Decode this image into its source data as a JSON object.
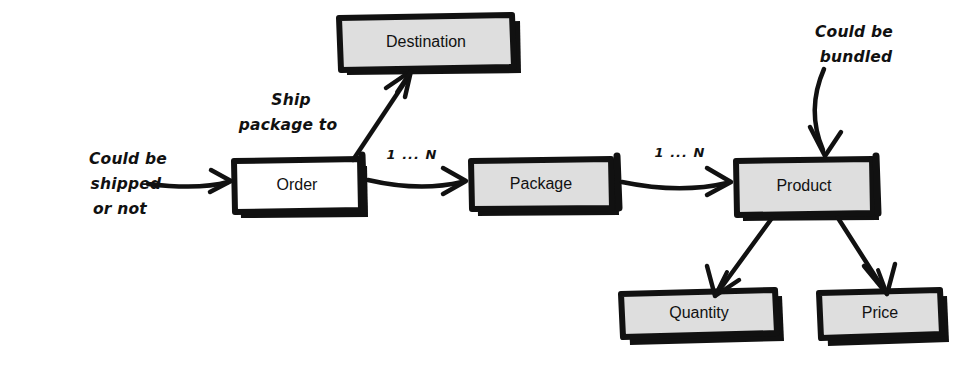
{
  "diagram": {
    "style": "hand-drawn sketch, black ink on white",
    "colors": {
      "ink": "#111111",
      "background": "#ffffff",
      "box_fill_gray": "#dedede",
      "box_fill_white": "#ffffff"
    },
    "nodes": [
      {
        "id": "destination",
        "label": "Destination",
        "fill": "#dedede",
        "x": 338,
        "y": 17,
        "width": 174,
        "height": 50
      },
      {
        "id": "order",
        "label": "Order",
        "fill": "#ffffff",
        "x": 233,
        "y": 160,
        "width": 127,
        "height": 50
      },
      {
        "id": "package",
        "label": "Package",
        "fill": "#dedede",
        "x": 470,
        "y": 160,
        "width": 142,
        "height": 48
      },
      {
        "id": "product",
        "label": "Product",
        "fill": "#dedede",
        "x": 735,
        "y": 160,
        "width": 137,
        "height": 53
      },
      {
        "id": "quantity",
        "label": "Quantity",
        "fill": "#dedede",
        "x": 620,
        "y": 293,
        "width": 155,
        "height": 40
      },
      {
        "id": "price",
        "label": "Price",
        "fill": "#dedede",
        "x": 818,
        "y": 292,
        "width": 122,
        "height": 43
      }
    ],
    "edges": [
      {
        "id": "external-to-order",
        "from": "annotation-shipped",
        "to": "order",
        "label": ""
      },
      {
        "id": "order-to-destination",
        "from": "order",
        "to": "destination",
        "label": "Ship package to"
      },
      {
        "id": "order-to-package",
        "from": "order",
        "to": "package",
        "label": "1 ... N"
      },
      {
        "id": "package-to-product",
        "from": "package",
        "to": "product",
        "label": "1 ... N"
      },
      {
        "id": "product-to-quantity",
        "from": "product",
        "to": "quantity",
        "label": ""
      },
      {
        "id": "product-to-price",
        "from": "product",
        "to": "price",
        "label": ""
      },
      {
        "id": "bundled-to-product",
        "from": "annotation-bundled",
        "to": "product",
        "label": ""
      }
    ],
    "annotations": [
      {
        "id": "annotation-shipped",
        "lines": [
          "Could be",
          "shipped",
          "or not"
        ],
        "x": 128,
        "y": 160
      },
      {
        "id": "annotation-bundled",
        "lines": [
          "Could be",
          "bundled"
        ],
        "x": 854,
        "y": 30
      }
    ],
    "edge_labels": {
      "ship_package_to_line1": "Ship",
      "ship_package_to_line2": "package to",
      "cardinality_order_package": "1 ... N",
      "cardinality_package_product": "1 ... N"
    }
  }
}
